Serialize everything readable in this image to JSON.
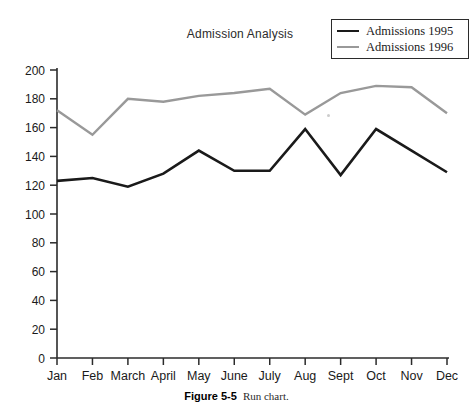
{
  "chart_data": {
    "type": "line",
    "title": "Admission Analysis",
    "xlabel": "",
    "ylabel": "",
    "categories": [
      "Jan",
      "Feb",
      "March",
      "April",
      "May",
      "June",
      "July",
      "Aug",
      "Sept",
      "Oct",
      "Nov",
      "Dec"
    ],
    "series": [
      {
        "name": "Admissions 1995",
        "color": "#1a1a1a",
        "values": [
          123,
          125,
          119,
          128,
          144,
          130,
          130,
          159,
          127,
          159,
          144,
          129
        ]
      },
      {
        "name": "Admissions 1996",
        "color": "#999999",
        "values": [
          172,
          155,
          180,
          178,
          182,
          184,
          187,
          169,
          184,
          189,
          188,
          170
        ]
      }
    ],
    "ylim": [
      0,
      200
    ],
    "yticks": [
      0,
      20,
      40,
      60,
      80,
      100,
      120,
      140,
      160,
      180,
      200
    ],
    "ytick_labels": [
      "0",
      "20",
      "40",
      "60",
      "80",
      "100",
      "120",
      "140",
      "160",
      "180",
      "200"
    ],
    "grid": false,
    "legend_position": "top-right"
  },
  "legend": {
    "entries": [
      {
        "label": "Admissions 1995",
        "color": "#1a1a1a"
      },
      {
        "label": "Admissions 1996",
        "color": "#999999"
      }
    ]
  },
  "caption": {
    "label": "Figure 5-5",
    "text": "Run chart."
  }
}
